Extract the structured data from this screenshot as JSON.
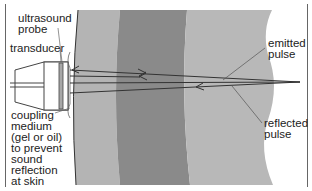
{
  "diagram": {
    "labels": {
      "ultrasound_probe": "ultrasound\nprobe",
      "transducer": "transducer",
      "coupling_medium": "coupling\nmedium\n(gel or oil)\nto prevent\nsound\nreflection\nat skin",
      "emitted_pulse": "emitted\npulse",
      "reflected_pulse": "reflected\npulse"
    },
    "colors": {
      "background": "#ffffff",
      "tissue_outer": "#b4b4b4",
      "tissue_middle": "#8a8a8a",
      "tissue_inner": "#b8b8b8",
      "lines": "#333333",
      "transducer": "#a8a8a8"
    }
  }
}
